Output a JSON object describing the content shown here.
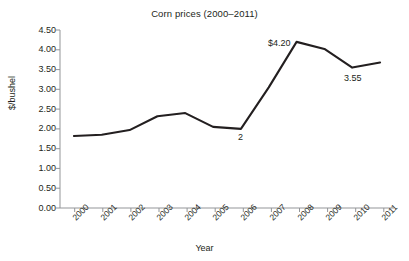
{
  "chart_data": {
    "type": "line",
    "title": "Corn prices (2000–2011)",
    "xlabel": "Year",
    "ylabel": "$/bushel",
    "categories": [
      "2000",
      "2001",
      "2002",
      "2003",
      "2004",
      "2005",
      "2006",
      "2007",
      "2008",
      "2009",
      "2010",
      "2011"
    ],
    "x": [
      2000,
      2001,
      2002,
      2003,
      2004,
      2005,
      2006,
      2007,
      2008,
      2009,
      2010,
      2011
    ],
    "values": [
      1.82,
      1.85,
      1.97,
      2.32,
      2.4,
      2.05,
      2.0,
      3.05,
      4.2,
      4.02,
      3.55,
      3.68
    ],
    "series": [
      {
        "name": "Corn price",
        "values": [
          1.82,
          1.85,
          1.97,
          2.32,
          2.4,
          2.05,
          2.0,
          3.05,
          4.2,
          4.02,
          3.55,
          3.68
        ]
      }
    ],
    "ylim": [
      0.0,
      4.5
    ],
    "ytick_values": [
      0.0,
      0.5,
      1.0,
      1.5,
      2.0,
      2.5,
      3.0,
      3.5,
      4.0,
      4.5
    ],
    "ytick_labels": [
      "0.00",
      "0.50",
      "1.00",
      "1.50",
      "2.00",
      "2.50",
      "3.00",
      "3.50",
      "4.00",
      "4.50"
    ],
    "grid": false,
    "legend": "none",
    "line_color": "#231f20",
    "axis_color": "#939598",
    "background_color": "#ffffff",
    "annotations": [
      {
        "text": "2",
        "x": 2006,
        "y": 2.0,
        "position": "below"
      },
      {
        "text": "$4.20",
        "x": 2008,
        "y": 4.2,
        "position": "above-left"
      },
      {
        "text": "3.55",
        "x": 2010,
        "y": 3.55,
        "position": "below"
      }
    ]
  },
  "labels": {
    "title": "Corn prices (2000–2011)",
    "x_axis": "Year",
    "y_axis": "$/bushel",
    "y_ticks": [
      "4.50",
      "4.00",
      "3.50",
      "3.00",
      "2.50",
      "2.00",
      "1.50",
      "1.00",
      "0.50",
      "0.00"
    ],
    "x_ticks": [
      "2000",
      "2001",
      "2002",
      "2003",
      "2004",
      "2005",
      "2006",
      "2007",
      "2008",
      "2009",
      "2010",
      "2011"
    ],
    "annotation_2006": "2",
    "annotation_2008": "$4.20",
    "annotation_2010": "3.55"
  }
}
